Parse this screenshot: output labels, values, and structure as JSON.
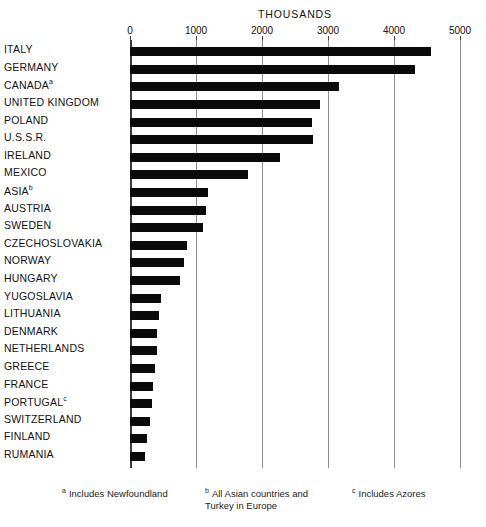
{
  "chart_data": {
    "type": "bar",
    "orientation": "horizontal",
    "title": "THOUSANDS",
    "xlabel": "THOUSANDS",
    "ylabel": "",
    "xlim": [
      0,
      5000
    ],
    "grid": true,
    "legend": null,
    "xticks": [
      0,
      1000,
      2000,
      3000,
      4000,
      5000
    ],
    "xtick_labels": [
      "0",
      "1000",
      "2000",
      "3000",
      "4000",
      "5000"
    ],
    "categories": [
      "ITALY",
      "GERMANY",
      "CANADA",
      "UNITED KINGDOM",
      "POLAND",
      "U.S.S.R.",
      "IRELAND",
      "MEXICO",
      "ASIA",
      "AUSTRIA",
      "SWEDEN",
      "CZECHOSLOVAKIA",
      "NORWAY",
      "HUNGARY",
      "YUGOSLAVIA",
      "LITHUANIA",
      "DENMARK",
      "NETHERLANDS",
      "GREECE",
      "FRANCE",
      "PORTUGAL",
      "SWITZERLAND",
      "FINLAND",
      "RUMANIA"
    ],
    "category_footnote_marks": [
      "",
      "",
      "a",
      "",
      "",
      "",
      "",
      "",
      "b",
      "",
      "",
      "",
      "",
      "",
      "",
      "",
      "",
      "",
      "",
      "",
      "c",
      "",
      "",
      ""
    ],
    "values": [
      4560,
      4320,
      3170,
      2880,
      2760,
      2770,
      2270,
      1790,
      1180,
      1150,
      1110,
      865,
      820,
      760,
      470,
      440,
      410,
      410,
      380,
      350,
      335,
      305,
      260,
      230
    ],
    "bar_color": "#0a0a0a",
    "grid_color": "#8e8e8e"
  },
  "footnotes": [
    {
      "mark": "a",
      "text": "Includes Newfoundland"
    },
    {
      "mark": "b",
      "text": "All Asian countries and Turkey in Europe"
    },
    {
      "mark": "c",
      "text": "Includes Azores"
    }
  ]
}
